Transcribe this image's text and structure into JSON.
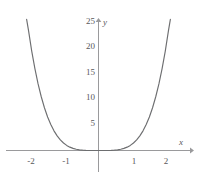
{
  "chart_data": {
    "type": "line",
    "title": "",
    "xlabel": "x",
    "ylabel": "y",
    "xlim": [
      -2.45,
      2.45
    ],
    "ylim": [
      -1.5,
      26.5
    ],
    "grid": false,
    "legend": null,
    "curve_color": "#6d6e70",
    "axis_color": "#9a9a9c",
    "background": "#ffffff",
    "x_ticks": [
      {
        "value": -2,
        "label": "-2"
      },
      {
        "value": -1,
        "label": "-1"
      },
      {
        "value": 1,
        "label": "1"
      },
      {
        "value": 2,
        "label": "2"
      }
    ],
    "y_ticks": [
      {
        "value": 5,
        "label": "5"
      },
      {
        "value": 10,
        "label": "10"
      },
      {
        "value": 15,
        "label": "15"
      },
      {
        "value": 20,
        "label": "20"
      },
      {
        "value": 25,
        "label": "25"
      }
    ],
    "series": [
      {
        "name": "quartic-curve",
        "x": [
          -2.26,
          -2.2,
          -2.1,
          -2.0,
          -1.9,
          -1.8,
          -1.7,
          -1.6,
          -1.5,
          -1.4,
          -1.3,
          -1.2,
          -1.1,
          -1.0,
          -0.9,
          -0.8,
          -0.7,
          -0.6,
          -0.5,
          -0.4,
          -0.3,
          -0.2,
          -0.1,
          0.0,
          0.1,
          0.2,
          0.3,
          0.4,
          0.5,
          0.6,
          0.7,
          0.8,
          0.9,
          1.0,
          1.1,
          1.2,
          1.3,
          1.4,
          1.5,
          1.6,
          1.7,
          1.8,
          1.9,
          2.0,
          2.1,
          2.2,
          2.26
        ],
        "y": [
          25.6,
          23.4,
          19.4,
          16.0,
          13.0,
          10.5,
          8.35,
          6.55,
          5.06,
          3.84,
          2.86,
          2.07,
          1.46,
          1.0,
          0.656,
          0.41,
          0.24,
          0.13,
          0.0625,
          0.0256,
          0.0081,
          0.0016,
          0.0001,
          0.0,
          0.0001,
          0.0016,
          0.0081,
          0.0256,
          0.0625,
          0.13,
          0.24,
          0.41,
          0.656,
          1.0,
          1.46,
          2.07,
          2.86,
          3.84,
          5.06,
          6.55,
          8.35,
          10.5,
          13.0,
          16.0,
          19.4,
          23.4,
          25.6
        ]
      }
    ]
  },
  "axis_labels": {
    "x": "x",
    "y": "y"
  }
}
